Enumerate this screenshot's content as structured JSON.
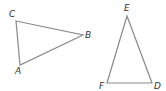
{
  "diagram": {
    "stroke_color": "#8a8a8a",
    "label_color": "#333333",
    "triangles": [
      {
        "name": "ABC",
        "vertices": [
          {
            "label": "C",
            "x": 16,
            "y": 21,
            "lx": 9,
            "ly": 17
          },
          {
            "label": "B",
            "x": 83,
            "y": 35,
            "lx": 85,
            "ly": 38
          },
          {
            "label": "A",
            "x": 20,
            "y": 65,
            "lx": 15,
            "ly": 74
          }
        ]
      },
      {
        "name": "DEF",
        "vertices": [
          {
            "label": "E",
            "x": 127,
            "y": 16,
            "lx": 124,
            "ly": 11
          },
          {
            "label": "D",
            "x": 152,
            "y": 83,
            "lx": 154,
            "ly": 89
          },
          {
            "label": "F",
            "x": 107,
            "y": 83,
            "lx": 99,
            "ly": 89
          }
        ]
      }
    ]
  }
}
